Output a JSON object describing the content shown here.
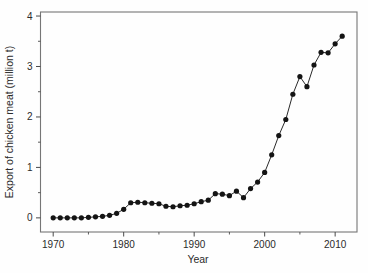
{
  "figure": {
    "kind": "scanned textbook scatter/line figure",
    "background": "#fefefe"
  },
  "chart_data": {
    "type": "line",
    "title": "",
    "xlabel": "Year",
    "ylabel": "Export of chicken meat (million t)",
    "legend": "none",
    "grid": false,
    "marker": "filled-circle",
    "xlim": [
      1968.2,
      2013.1
    ],
    "ylim": [
      -0.28,
      4.08
    ],
    "x_ticks": [
      1970,
      1980,
      1990,
      2000,
      2010
    ],
    "x_minor_ticks": [
      1975,
      1985,
      1995,
      2005
    ],
    "y_ticks": [
      0,
      1,
      2,
      3,
      4
    ],
    "y_minor_ticks": [
      0.5,
      1.5,
      2.5,
      3.5
    ],
    "colors": {
      "point": "#141414",
      "line": "#2a2a2a",
      "frame": "#767676",
      "tick": "#4a4a4a",
      "label": "#2b2b2b",
      "background": "#fefefe"
    },
    "series": [
      {
        "name": "Chicken meat export (million t)",
        "x": [
          1970,
          1971,
          1972,
          1973,
          1974,
          1975,
          1976,
          1977,
          1978,
          1979,
          1980,
          1981,
          1982,
          1983,
          1984,
          1985,
          1986,
          1987,
          1988,
          1989,
          1990,
          1991,
          1992,
          1993,
          1994,
          1995,
          1996,
          1997,
          1998,
          1999,
          2000,
          2001,
          2002,
          2003,
          2004,
          2005,
          2006,
          2007,
          2008,
          2009,
          2010,
          2011
        ],
        "y": [
          0.0,
          0.0,
          0.0,
          0.0,
          0.0,
          0.01,
          0.02,
          0.03,
          0.05,
          0.09,
          0.17,
          0.3,
          0.31,
          0.3,
          0.29,
          0.28,
          0.23,
          0.22,
          0.24,
          0.25,
          0.28,
          0.32,
          0.35,
          0.48,
          0.47,
          0.44,
          0.53,
          0.4,
          0.58,
          0.71,
          0.9,
          1.25,
          1.63,
          1.95,
          2.45,
          2.8,
          2.6,
          3.03,
          3.28,
          3.27,
          3.45,
          3.6
        ]
      }
    ]
  }
}
